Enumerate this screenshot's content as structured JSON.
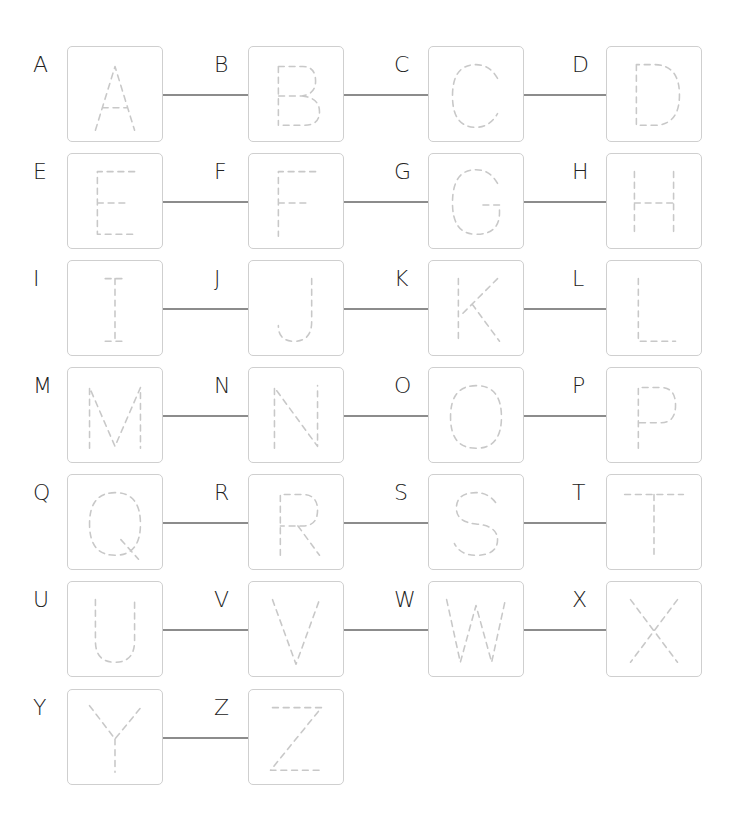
{
  "worksheet": {
    "layout": {
      "columns": 4,
      "col_x": [
        67,
        248,
        428,
        606
      ],
      "row_y": [
        46,
        153,
        260,
        367,
        474,
        581,
        689
      ],
      "box_size": 96,
      "label_offset_x": -34,
      "label_offset_y": 8
    },
    "colors": {
      "box_border": "#cfcfcf",
      "trace_stroke": "#c8c8c8",
      "connector": "#8c8c8c",
      "label": "#222222"
    },
    "letters": [
      {
        "label": "A",
        "trace": "A"
      },
      {
        "label": "B",
        "trace": "B"
      },
      {
        "label": "C",
        "trace": "C"
      },
      {
        "label": "D",
        "trace": "D"
      },
      {
        "label": "E",
        "trace": "E"
      },
      {
        "label": "F",
        "trace": "F"
      },
      {
        "label": "G",
        "trace": "G"
      },
      {
        "label": "H",
        "trace": "H"
      },
      {
        "label": "I",
        "trace": "I"
      },
      {
        "label": "J",
        "trace": "J"
      },
      {
        "label": "K",
        "trace": "K"
      },
      {
        "label": "L",
        "trace": "L"
      },
      {
        "label": "M",
        "trace": "M"
      },
      {
        "label": "N",
        "trace": "N"
      },
      {
        "label": "O",
        "trace": "O"
      },
      {
        "label": "P",
        "trace": "P"
      },
      {
        "label": "Q",
        "trace": "Q"
      },
      {
        "label": "R",
        "trace": "R"
      },
      {
        "label": "S",
        "trace": "S"
      },
      {
        "label": "T",
        "trace": "T"
      },
      {
        "label": "U",
        "trace": "U"
      },
      {
        "label": "V",
        "trace": "V"
      },
      {
        "label": "W",
        "trace": "W"
      },
      {
        "label": "X",
        "trace": "X"
      },
      {
        "label": "Y",
        "trace": "Y"
      },
      {
        "label": "Z",
        "trace": "Z"
      }
    ]
  }
}
